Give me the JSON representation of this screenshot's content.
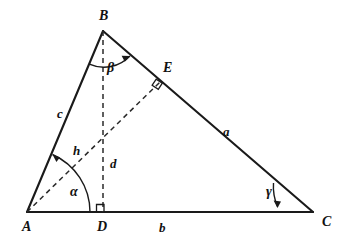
{
  "figure": {
    "kind": "geometry-diagram",
    "background_color": "#ffffff",
    "stroke_color": "#1a1a1a",
    "dash_color": "#2a2a2a"
  },
  "vertices": [
    {
      "name": "A",
      "label": "A",
      "x": 27,
      "y": 212,
      "label_x": 22,
      "label_y": 231
    },
    {
      "name": "B",
      "label": "B",
      "x": 103,
      "y": 31,
      "label_x": 99,
      "label_y": 20
    },
    {
      "name": "C",
      "label": "C",
      "x": 313,
      "y": 212,
      "label_x": 322,
      "label_y": 226
    },
    {
      "name": "D",
      "label": "D",
      "x": 103,
      "y": 212,
      "label_x": 97,
      "label_y": 231
    },
    {
      "name": "E",
      "label": "E",
      "x": 160,
      "y": 82,
      "label_x": 163,
      "label_y": 72
    }
  ],
  "sides": [
    {
      "name": "a",
      "label": "a",
      "from": "B",
      "to": "C",
      "style": "solid",
      "label_x": 223,
      "label_y": 136
    },
    {
      "name": "b",
      "label": "b",
      "from": "A",
      "to": "C",
      "style": "solid",
      "label_x": 159,
      "label_y": 232
    },
    {
      "name": "c",
      "label": "c",
      "from": "A",
      "to": "B",
      "style": "solid",
      "label_x": 57,
      "label_y": 118
    }
  ],
  "segments": [
    {
      "name": "h",
      "label": "h",
      "from": "A",
      "to": "E",
      "style": "dashed",
      "label_x": 73,
      "label_y": 155
    },
    {
      "name": "d",
      "label": "d",
      "from": "B",
      "to": "D",
      "style": "dashed",
      "label_x": 110,
      "label_y": 168
    }
  ],
  "angles": [
    {
      "name": "alpha",
      "label": "α",
      "at": "A",
      "label_x": 70,
      "label_y": 196
    },
    {
      "name": "beta",
      "label": "β",
      "at": "B",
      "label_x": 107,
      "label_y": 72
    },
    {
      "name": "gamma",
      "label": "γ",
      "at": "C",
      "label_x": 266,
      "label_y": 196
    }
  ],
  "right_angles": [
    {
      "name": "right-angle-at-D",
      "at": "D",
      "x": 103,
      "y": 212
    },
    {
      "name": "right-angle-at-E",
      "at": "E",
      "x": 160,
      "y": 82
    }
  ]
}
